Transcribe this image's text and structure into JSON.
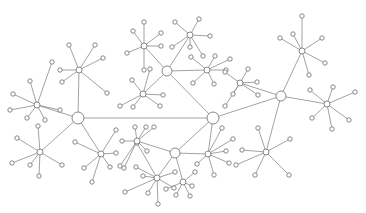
{
  "diagram": {
    "type": "network",
    "stroke_color": "#8a8a8a",
    "node_fill": "#ffffff",
    "hubs": [
      {
        "id": "A",
        "x": 78,
        "y": 118,
        "r": 6
      },
      {
        "id": "B",
        "x": 213,
        "y": 118,
        "r": 6
      },
      {
        "id": "C",
        "x": 167,
        "y": 71,
        "r": 5
      },
      {
        "id": "D",
        "x": 281,
        "y": 96,
        "r": 5
      },
      {
        "id": "E",
        "x": 175,
        "y": 153,
        "r": 5
      }
    ],
    "clusters": [
      {
        "cx": 37,
        "cy": 105,
        "r": 3,
        "leaves": [
          [
            13,
            94
          ],
          [
            30,
            81
          ],
          [
            52,
            62
          ],
          [
            10,
            110
          ],
          [
            27,
            118
          ],
          [
            45,
            120
          ],
          [
            60,
            110
          ]
        ]
      },
      {
        "cx": 79,
        "cy": 70,
        "r": 3,
        "leaves": [
          [
            69,
            45
          ],
          [
            95,
            45
          ],
          [
            103,
            58
          ],
          [
            60,
            70
          ],
          [
            62,
            82
          ],
          [
            107,
            93
          ]
        ]
      },
      {
        "cx": 40,
        "cy": 152,
        "r": 3,
        "leaves": [
          [
            17,
            138
          ],
          [
            12,
            163
          ],
          [
            38,
            126
          ],
          [
            30,
            165
          ],
          [
            39,
            176
          ],
          [
            62,
            165
          ]
        ]
      },
      {
        "cx": 101,
        "cy": 154,
        "r": 3,
        "leaves": [
          [
            116,
            130
          ],
          [
            116,
            153
          ],
          [
            110,
            167
          ],
          [
            84,
            168
          ],
          [
            92,
            182
          ],
          [
            75,
            142
          ]
        ]
      },
      {
        "cx": 144,
        "cy": 46,
        "r": 3,
        "leaves": [
          [
            144,
            22
          ],
          [
            133,
            31
          ],
          [
            161,
            33
          ],
          [
            161,
            46
          ],
          [
            127,
            53
          ],
          [
            144,
            70
          ]
        ]
      },
      {
        "cx": 190,
        "cy": 35,
        "r": 3,
        "leaves": [
          [
            175,
            22
          ],
          [
            199,
            19
          ],
          [
            210,
            36
          ],
          [
            172,
            47
          ],
          [
            190,
            47
          ],
          [
            203,
            56
          ]
        ]
      },
      {
        "cx": 143,
        "cy": 94,
        "r": 3,
        "leaves": [
          [
            150,
            69
          ],
          [
            132,
            80
          ],
          [
            163,
            95
          ],
          [
            120,
            106
          ],
          [
            133,
            107
          ],
          [
            160,
            106
          ]
        ]
      },
      {
        "cx": 207,
        "cy": 70,
        "r": 3,
        "leaves": [
          [
            191,
            57
          ],
          [
            215,
            56
          ],
          [
            230,
            59
          ],
          [
            226,
            70
          ],
          [
            193,
            83
          ],
          [
            214,
            84
          ]
        ]
      },
      {
        "cx": 240,
        "cy": 83,
        "r": 3,
        "leaves": [
          [
            225,
            72
          ],
          [
            248,
            69
          ],
          [
            257,
            82
          ],
          [
            233,
            94
          ],
          [
            258,
            95
          ],
          [
            225,
            106
          ]
        ]
      },
      {
        "cx": 302,
        "cy": 51,
        "r": 3,
        "leaves": [
          [
            302,
            16
          ],
          [
            293,
            34
          ],
          [
            322,
            38
          ],
          [
            280,
            38
          ],
          [
            325,
            63
          ],
          [
            309,
            75
          ]
        ]
      },
      {
        "cx": 327,
        "cy": 104,
        "r": 3,
        "leaves": [
          [
            310,
            90
          ],
          [
            333,
            87
          ],
          [
            355,
            92
          ],
          [
            312,
            118
          ],
          [
            349,
            120
          ],
          [
            332,
            129
          ]
        ]
      },
      {
        "cx": 208,
        "cy": 154,
        "r": 3,
        "leaves": [
          [
            222,
            128
          ],
          [
            233,
            139
          ],
          [
            226,
            151
          ],
          [
            229,
            163
          ],
          [
            197,
            164
          ],
          [
            214,
            175
          ]
        ]
      },
      {
        "cx": 266,
        "cy": 152,
        "r": 3,
        "leaves": [
          [
            258,
            128
          ],
          [
            290,
            139
          ],
          [
            242,
            150
          ],
          [
            236,
            165
          ],
          [
            255,
            175
          ],
          [
            289,
            175
          ]
        ]
      },
      {
        "cx": 157,
        "cy": 178,
        "r": 3,
        "leaves": [
          [
            137,
            143
          ],
          [
            136,
            167
          ],
          [
            143,
            176
          ],
          [
            125,
            192
          ],
          [
            148,
            193
          ],
          [
            158,
            204
          ],
          [
            175,
            172
          ],
          [
            174,
            188
          ]
        ]
      },
      {
        "cx": 137,
        "cy": 141,
        "r": 3,
        "leaves": [
          [
            135,
            127
          ],
          [
            146,
            127
          ],
          [
            154,
            127
          ],
          [
            122,
            141
          ],
          [
            147,
            151
          ],
          [
            120,
            166
          ],
          [
            124,
            168
          ]
        ]
      },
      {
        "cx": 183,
        "cy": 182,
        "r": 3,
        "leaves": [
          [
            195,
            172
          ],
          [
            192,
            186
          ],
          [
            176,
            195
          ],
          [
            190,
            196
          ],
          [
            166,
            189
          ]
        ]
      }
    ],
    "edges": [
      [
        "A",
        "B"
      ],
      [
        "A",
        37,
        105
      ],
      [
        "A",
        79,
        70
      ],
      [
        "A",
        40,
        152
      ],
      [
        "A",
        101,
        154
      ],
      [
        "B",
        "C"
      ],
      [
        "B",
        "D"
      ],
      [
        "B",
        "E"
      ],
      [
        "B",
        208,
        154
      ],
      [
        "C",
        144,
        46
      ],
      [
        "C",
        190,
        35
      ],
      [
        "C",
        143,
        94
      ],
      [
        "C",
        207,
        70
      ],
      [
        "D",
        240,
        83
      ],
      [
        "D",
        302,
        51
      ],
      [
        "D",
        327,
        104
      ],
      [
        "D",
        266,
        152
      ],
      [
        "E",
        137,
        141
      ],
      [
        "E",
        157,
        178
      ],
      [
        "E",
        183,
        182
      ],
      [
        "E",
        208,
        154
      ]
    ]
  }
}
